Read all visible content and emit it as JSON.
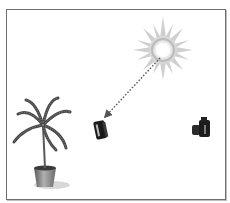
{
  "figure": {
    "caption": "",
    "elements": [
      {
        "id": "sun",
        "label": "sun-icon",
        "cx": 163,
        "cy": 50
      },
      {
        "id": "light-ray",
        "label": "dotted-arrow",
        "from": [
          160,
          58
        ],
        "to": [
          104,
          118
        ]
      },
      {
        "id": "tablet",
        "label": "tablet-device-icon",
        "x": 96,
        "y": 120
      },
      {
        "id": "camera",
        "label": "camera-icon",
        "x": 193,
        "y": 118
      },
      {
        "id": "plant",
        "label": "potted-palm-plant",
        "x": 14,
        "y": 100
      }
    ]
  },
  "colors": {
    "frame": "#6e6e6e",
    "sun_rays": "#c9c9c9",
    "sun_ring": "#bcbcbc",
    "arrow": "#555555",
    "device": "#1a1a1a",
    "foliage": "#4a4a4a",
    "pot": "#7a7a7a"
  }
}
